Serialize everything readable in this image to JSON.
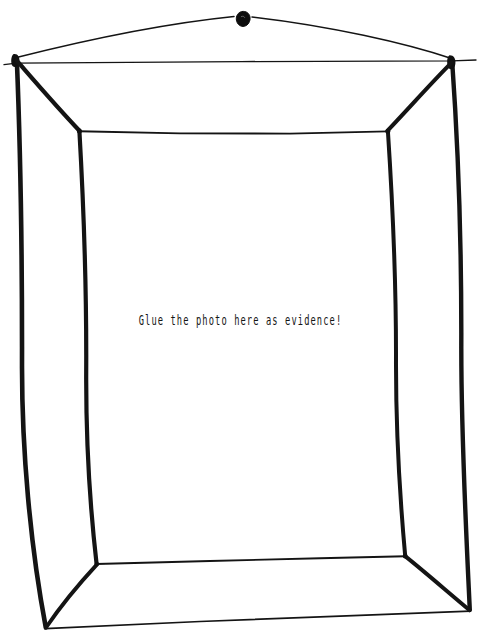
{
  "artwork": {
    "kind": "hand-drawn-sketch",
    "subject": "empty picture frame hanging from a nail",
    "background_color": "#ffffff",
    "ink_color": "#111111"
  },
  "frame": {
    "caption": {
      "text": "Glue the photo here as evidence!",
      "x": 243,
      "y": 322,
      "color": "#151515"
    },
    "mat_area_label": "empty photo area",
    "hanging": {
      "nail_label": "nail",
      "nail_x": 243,
      "nail_y": 18,
      "nail_color": "#0d0d0d",
      "wire_label": "hanging wire"
    },
    "outer_corners": {
      "top_left": "16,57",
      "top_right": "452,59",
      "bottom_left": "46,627",
      "bottom_right": "470,611"
    },
    "inner_corners": {
      "top_left": "80,131",
      "top_right": "387,131",
      "bottom_left": "97,564",
      "bottom_right": "405,556"
    }
  }
}
